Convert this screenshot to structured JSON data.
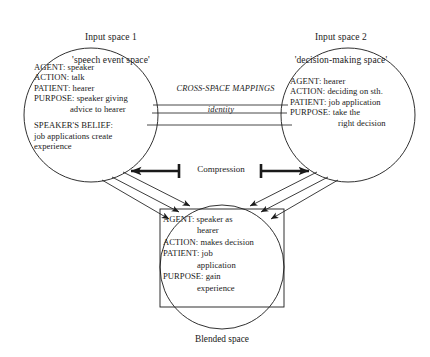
{
  "diagram": {
    "title_hidden": "Conceptual integration network",
    "background_color": "#ffffff",
    "stroke_color": "#1a1a1a",
    "input1": {
      "caption_line1": "Input space 1",
      "caption_line2": "'speech event space'",
      "lines": [
        {
          "text": "AGENT: speaker",
          "indent": false
        },
        {
          "text": "ACTION: talk",
          "indent": false
        },
        {
          "text": "PATIENT: hearer",
          "indent": false
        },
        {
          "text": "PURPOSE: speaker giving",
          "indent": false
        },
        {
          "text": "advice to hearer",
          "indent": true
        },
        {
          "text": "",
          "indent": false
        },
        {
          "text": "SPEAKER'S BELIEF:",
          "indent": false
        },
        {
          "text": "job applications create",
          "indent": false
        },
        {
          "text": "experience",
          "indent": false
        }
      ]
    },
    "input2": {
      "caption_line1": "Input space 2",
      "caption_line2": "'decision-making space'",
      "lines": [
        {
          "text": "AGENT: hearer",
          "indent": false
        },
        {
          "text": "ACTION: deciding on sth.",
          "indent": false
        },
        {
          "text": "PATIENT: job application",
          "indent": false
        },
        {
          "text": "PURPOSE: take the",
          "indent": false
        },
        {
          "text": "right decision",
          "indent": true
        }
      ]
    },
    "mappings": {
      "heading": "CROSS-SPACE MAPPINGS",
      "subheading": "identity",
      "line_count": 3
    },
    "compression": {
      "label": "Compression"
    },
    "blend": {
      "caption": "Blended space",
      "lines": [
        {
          "text": "AGENT: speaker as",
          "indent": false
        },
        {
          "text": "hearer",
          "indent": true
        },
        {
          "text": "ACTION: makes decision",
          "indent": false
        },
        {
          "text": "PATIENT: job",
          "indent": false
        },
        {
          "text": "application",
          "indent": true
        },
        {
          "text": "PURPOSE: gain",
          "indent": false
        },
        {
          "text": "experience",
          "indent": true
        }
      ]
    },
    "projection_arrows": {
      "left_count": 3,
      "right_count": 3
    }
  }
}
